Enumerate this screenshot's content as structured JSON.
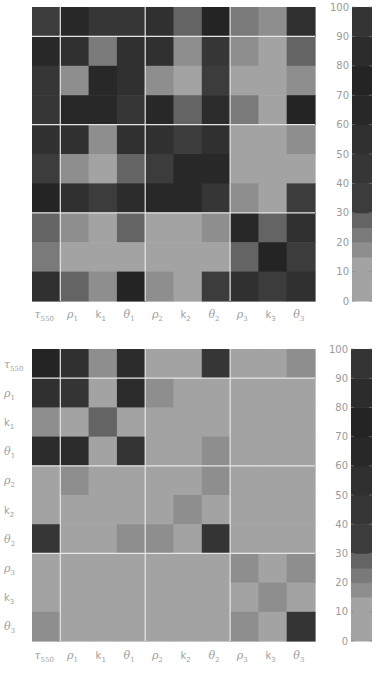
{
  "chart_data": [
    {
      "type": "heatmap",
      "title": "",
      "xlabel": "",
      "ylabel": "",
      "x_labels": [
        "τ550",
        "ρ1",
        "k1",
        "θ1",
        "ρ2",
        "k2",
        "θ2",
        "ρ3",
        "k3",
        "θ3"
      ],
      "y_labels": [],
      "group_boundaries_after_index": [
        0,
        3,
        6
      ],
      "values": [
        [
          40,
          65,
          45,
          42,
          55,
          30,
          75,
          22,
          17,
          60
        ],
        [
          70,
          60,
          25,
          60,
          55,
          20,
          45,
          20,
          12,
          27
        ],
        [
          50,
          20,
          65,
          60,
          18,
          14,
          35,
          12,
          12,
          18
        ],
        [
          45,
          70,
          65,
          45,
          65,
          28,
          85,
          25,
          14,
          75
        ],
        [
          60,
          60,
          20,
          60,
          55,
          32,
          60,
          12,
          12,
          18
        ],
        [
          32,
          18,
          15,
          27,
          32,
          65,
          65,
          12,
          12,
          14
        ],
        [
          75,
          60,
          32,
          85,
          65,
          65,
          45,
          20,
          14,
          32
        ],
        [
          28,
          20,
          12,
          28,
          12,
          12,
          20,
          65,
          30,
          60
        ],
        [
          22,
          13,
          13,
          15,
          12,
          12,
          14,
          28,
          80,
          32
        ],
        [
          60,
          27,
          20,
          75,
          20,
          14,
          40,
          60,
          35,
          55
        ]
      ],
      "colorbar": {
        "ticks": [
          0,
          10,
          20,
          30,
          40,
          50,
          60,
          70,
          80,
          90,
          100
        ],
        "range": [
          0,
          100
        ]
      }
    },
    {
      "type": "heatmap",
      "title": "",
      "xlabel": "",
      "ylabel": "",
      "x_labels": [
        "τ550",
        "ρ1",
        "k1",
        "θ1",
        "ρ2",
        "k2",
        "θ2",
        "ρ3",
        "k3",
        "θ3"
      ],
      "y_labels": [
        "τ550",
        "ρ1",
        "k1",
        "θ1",
        "ρ2",
        "k2",
        "θ2",
        "ρ3",
        "k3",
        "θ3"
      ],
      "group_boundaries_after_index": [
        0,
        3,
        6
      ],
      "values": [
        [
          80,
          60,
          20,
          85,
          12,
          12,
          45,
          10,
          10,
          20
        ],
        [
          60,
          100,
          10,
          85,
          20,
          12,
          14,
          12,
          12,
          13
        ],
        [
          20,
          10,
          27,
          10,
          10,
          10,
          10,
          10,
          10,
          10
        ],
        [
          85,
          85,
          10,
          100,
          14,
          12,
          20,
          12,
          10,
          14
        ],
        [
          13,
          20,
          10,
          14,
          14,
          14,
          20,
          10,
          10,
          10
        ],
        [
          10,
          10,
          10,
          10,
          12,
          20,
          12,
          10,
          10,
          10
        ],
        [
          45,
          14,
          12,
          20,
          20,
          12,
          100,
          10,
          10,
          10
        ],
        [
          12,
          12,
          11,
          12,
          10,
          10,
          10,
          20,
          10,
          20
        ],
        [
          10,
          10,
          10,
          10,
          10,
          10,
          10,
          10,
          20,
          10
        ],
        [
          20,
          12,
          10,
          14,
          10,
          10,
          11,
          20,
          10,
          100
        ]
      ],
      "colorbar": {
        "ticks": [
          0,
          10,
          20,
          30,
          40,
          50,
          60,
          70,
          80,
          90,
          100
        ],
        "range": [
          0,
          100
        ]
      }
    }
  ],
  "colormap": {
    "stops": [
      {
        "max": 15,
        "color": "#a3a3a3"
      },
      {
        "max": 20,
        "color": "#8e8e8e"
      },
      {
        "max": 25,
        "color": "#7a7a7a"
      },
      {
        "max": 30,
        "color": "#646464"
      },
      {
        "max": 40,
        "color": "#3c3c3c"
      },
      {
        "max": 50,
        "color": "#363636"
      },
      {
        "max": 60,
        "color": "#303030"
      },
      {
        "max": 70,
        "color": "#282828"
      },
      {
        "max": 80,
        "color": "#242424"
      },
      {
        "max": 90,
        "color": "#2c2c2c"
      },
      {
        "max": 100,
        "color": "#343434"
      }
    ]
  }
}
